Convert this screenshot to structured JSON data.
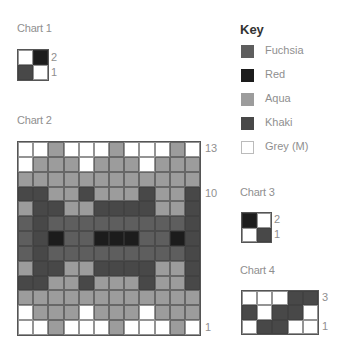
{
  "colors": {
    "F": "#5e5e5e",
    "R": "#1c1c1c",
    "A": "#9c9c9c",
    "K": "#484848",
    "W": "#ffffff"
  },
  "key": {
    "title": "Key",
    "items": [
      {
        "code": "F",
        "label": "Fuchsia"
      },
      {
        "code": "R",
        "label": "Red"
      },
      {
        "code": "A",
        "label": "Aqua"
      },
      {
        "code": "K",
        "label": "Khaki"
      },
      {
        "code": "W",
        "label": "Grey (M)"
      }
    ]
  },
  "charts": [
    {
      "title": "Chart 1",
      "row_labels": [
        "2",
        "1"
      ],
      "rows": [
        [
          "W",
          "R"
        ],
        [
          "K",
          "W"
        ]
      ]
    },
    {
      "title": "Chart 2",
      "row_labels": [
        "13",
        "10",
        "1"
      ],
      "rows": [
        [
          "W",
          "W",
          "A",
          "W",
          "W",
          "W",
          "A",
          "W",
          "W",
          "W",
          "A",
          "W"
        ],
        [
          "W",
          "A",
          "A",
          "A",
          "W",
          "A",
          "A",
          "A",
          "W",
          "A",
          "A",
          "A"
        ],
        [
          "A",
          "A",
          "A",
          "A",
          "A",
          "A",
          "A",
          "A",
          "A",
          "A",
          "A",
          "A"
        ],
        [
          "K",
          "K",
          "A",
          "A",
          "K",
          "A",
          "A",
          "A",
          "K",
          "A",
          "A",
          "K"
        ],
        [
          "A",
          "K",
          "K",
          "A",
          "A",
          "K",
          "K",
          "K",
          "K",
          "A",
          "A",
          "K"
        ],
        [
          "F",
          "K",
          "F",
          "F",
          "F",
          "F",
          "F",
          "F",
          "F",
          "F",
          "F",
          "K"
        ],
        [
          "F",
          "K",
          "R",
          "F",
          "F",
          "R",
          "R",
          "R",
          "F",
          "F",
          "R",
          "K"
        ],
        [
          "F",
          "K",
          "F",
          "F",
          "F",
          "F",
          "F",
          "F",
          "F",
          "F",
          "F",
          "K"
        ],
        [
          "A",
          "K",
          "K",
          "A",
          "A",
          "K",
          "K",
          "K",
          "K",
          "A",
          "A",
          "K"
        ],
        [
          "K",
          "K",
          "A",
          "A",
          "K",
          "A",
          "A",
          "A",
          "K",
          "A",
          "A",
          "K"
        ],
        [
          "A",
          "A",
          "A",
          "A",
          "A",
          "A",
          "A",
          "A",
          "A",
          "A",
          "A",
          "A"
        ],
        [
          "W",
          "A",
          "A",
          "A",
          "W",
          "A",
          "A",
          "A",
          "W",
          "A",
          "A",
          "A"
        ],
        [
          "W",
          "W",
          "A",
          "W",
          "W",
          "W",
          "A",
          "W",
          "W",
          "W",
          "A",
          "W"
        ]
      ]
    },
    {
      "title": "Chart 3",
      "row_labels": [
        "2",
        "1"
      ],
      "rows": [
        [
          "R",
          "W"
        ],
        [
          "W",
          "K"
        ]
      ]
    },
    {
      "title": "Chart 4",
      "row_labels": [
        "3",
        "1"
      ],
      "rows": [
        [
          "W",
          "W",
          "W",
          "K",
          "K"
        ],
        [
          "K",
          "W",
          "K",
          "K",
          "W"
        ],
        [
          "W",
          "K",
          "K",
          "W",
          "W"
        ]
      ]
    }
  ]
}
